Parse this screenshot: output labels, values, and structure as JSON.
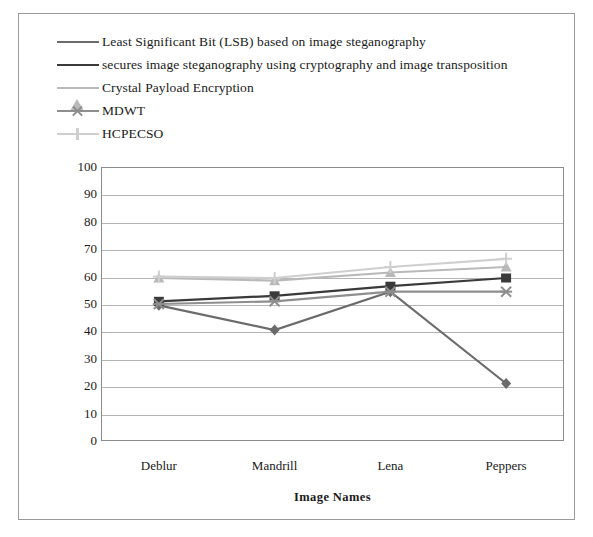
{
  "figure": {
    "border_color": "#9a9a9a",
    "background": "#ffffff"
  },
  "legend": {
    "position": "top-left",
    "items": [
      {
        "label": "Least Significant Bit (LSB) based on image steganography",
        "marker": "diamond-icon",
        "color": "#6b6b6b"
      },
      {
        "label": "secures image steganography using cryptography and image transposition",
        "marker": "square-icon",
        "color": "#3a3a3a"
      },
      {
        "label": "Crystal Payload Encryption",
        "marker": "triangle-icon",
        "color": "#b9b9b9"
      },
      {
        "label": "MDWT",
        "marker": "x-icon",
        "color": "#8e8e8e"
      },
      {
        "label": "HCPECSO",
        "marker": "plus-icon",
        "color": "#cfcfcf"
      }
    ]
  },
  "axes": {
    "y_title": "Peak Signal to Noise Ratio (dB)",
    "x_title": "Image Names",
    "y_ticks": [
      "100",
      "90",
      "80",
      "70",
      "60",
      "50",
      "40",
      "30",
      "20",
      "10",
      "0"
    ],
    "x_ticks": [
      "Deblur",
      "Mandrill",
      "Lena",
      "Peppers"
    ]
  },
  "chart_data": {
    "type": "line",
    "title": "",
    "xlabel": "Image Names",
    "ylabel": "Peak Signal to Noise Ratio (dB)",
    "categories": [
      "Deblur",
      "Mandrill",
      "Lena",
      "Peppers"
    ],
    "ylim": [
      0,
      100
    ],
    "ytick_step": 10,
    "grid": true,
    "legend_position": "top-left",
    "series": [
      {
        "name": "Least Significant Bit (LSB) based on image steganography",
        "marker": "diamond",
        "color": "#6b6b6b",
        "values": [
          49.5,
          40.5,
          54.5,
          21
        ]
      },
      {
        "name": "secures image steganography using cryptography and image transposition",
        "marker": "square",
        "color": "#3a3a3a",
        "values": [
          51,
          53,
          56.5,
          59.5
        ]
      },
      {
        "name": "Crystal Payload Encryption",
        "marker": "triangle",
        "color": "#b9b9b9",
        "values": [
          59.5,
          58.5,
          61.5,
          63.5
        ]
      },
      {
        "name": "MDWT",
        "marker": "x",
        "color": "#8e8e8e",
        "values": [
          50,
          51,
          54.5,
          54.5
        ]
      },
      {
        "name": "HCPECSO",
        "marker": "plus",
        "color": "#cfcfcf",
        "values": [
          60,
          59.5,
          63.5,
          66.5
        ]
      }
    ]
  }
}
